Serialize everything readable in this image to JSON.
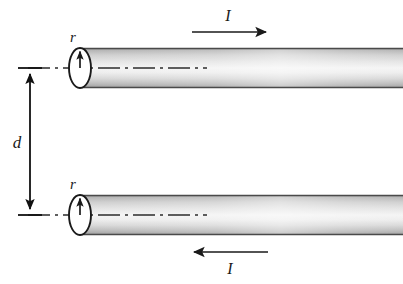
{
  "figure": {
    "background_color": "#ffffff",
    "width": 403,
    "height": 284
  },
  "labels": {
    "radius_top": "r",
    "radius_bottom": "r",
    "separation": "d",
    "current_top": "I",
    "current_bottom": "I"
  },
  "colors": {
    "outline": "#1a1a1a",
    "centerline": "#2b2b2b",
    "dimension": "#111111",
    "cylinder_dark": "#9a9a9a",
    "cylinder_mid": "#c8c8c8",
    "cylinder_light": "#fdfdfd",
    "cylinder_edge": "#6e6e6e",
    "cap_fill": "#ffffff"
  },
  "geometry": {
    "top_cylinder": {
      "y_top": 48,
      "y_bottom": 88,
      "axis_y": 68,
      "x_left": 80,
      "x_right": 403,
      "cap_cx": 80,
      "cap_rx": 11,
      "cap_ry": 20
    },
    "bottom_cylinder": {
      "y_top": 195,
      "y_bottom": 235,
      "axis_y": 215,
      "x_left": 80,
      "x_right": 403,
      "cap_cx": 80,
      "cap_rx": 11,
      "cap_ry": 20
    },
    "dimension_line": {
      "x": 30,
      "y_start": 68,
      "y_end": 215,
      "tick_half_width": 12
    },
    "current_arrow_top": {
      "x_start": 192,
      "x_end": 268,
      "y": 32,
      "direction": "right"
    },
    "current_arrow_bottom": {
      "x_start": 268,
      "x_end": 190,
      "y": 252,
      "direction": "left"
    }
  },
  "annotations": {
    "top_current_direction": "rightward",
    "bottom_current_direction": "leftward",
    "centerline_style": "dash-dot"
  }
}
